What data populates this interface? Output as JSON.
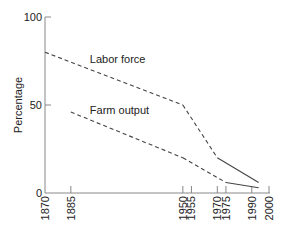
{
  "chart_data": {
    "type": "line",
    "title": "",
    "xlabel": "",
    "ylabel": "Percentage",
    "xlim": [
      1870,
      2000
    ],
    "ylim": [
      0,
      100
    ],
    "grid": false,
    "legend": "inline labels",
    "x_ticks": [
      1870,
      1885,
      1950,
      1955,
      1970,
      1975,
      1990,
      2000
    ],
    "y_ticks": [
      0,
      50,
      100
    ],
    "series": [
      {
        "name": "Labor force",
        "points": [
          {
            "x": 1870,
            "y": 80,
            "style": "dashed"
          },
          {
            "x": 1950,
            "y": 50,
            "style": "dashed"
          },
          {
            "x": 1970,
            "y": 20,
            "style": "solid"
          },
          {
            "x": 1994,
            "y": 6,
            "style": "solid"
          }
        ],
        "label_position": {
          "x": 1896,
          "y": 74
        }
      },
      {
        "name": "Farm output",
        "points": [
          {
            "x": 1885,
            "y": 46,
            "style": "dashed"
          },
          {
            "x": 1950,
            "y": 20,
            "style": "dashed"
          },
          {
            "x": 1975,
            "y": 6,
            "style": "solid"
          },
          {
            "x": 1994,
            "y": 3,
            "style": "solid"
          }
        ],
        "label_position": {
          "x": 1896,
          "y": 45
        }
      }
    ],
    "annotations": [
      "Dashed segments before 1950; solid segments after 1950"
    ]
  },
  "colors": {
    "line": "#444444",
    "axis": "#888888",
    "text": "#222222"
  }
}
